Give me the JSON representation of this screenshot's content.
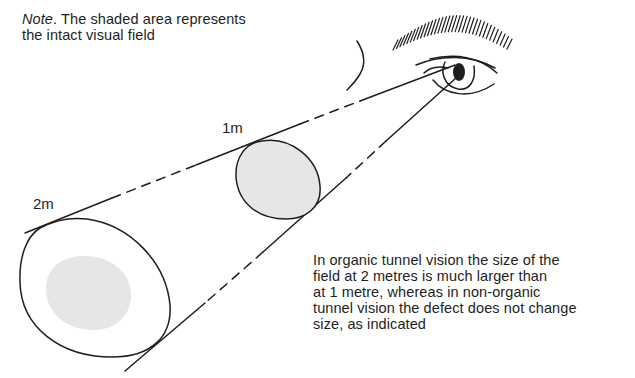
{
  "note": {
    "lead": "Note",
    "text": ". The shaded area represents the intact visual field"
  },
  "labels": {
    "near": "1m",
    "far": "2m"
  },
  "caption": "In organic tunnel vision the size of the\nfield at 2 metres is much larger than\nat 1 metre, whereas in non-organic\ntunnel vision the defect does not change\nsize, as indicated",
  "colors": {
    "ink": "#1e1e1e",
    "shade": "#e6e6e6"
  }
}
